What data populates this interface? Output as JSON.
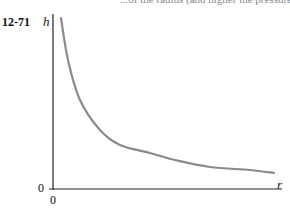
{
  "header": {
    "top_text": "...of the radius (and higher the pressure).",
    "problem_number": "12-71"
  },
  "chart_data": {
    "type": "line",
    "title": "",
    "xlabel": "r",
    "ylabel": "h",
    "x_tick_labels": [
      "0"
    ],
    "y_tick_labels": [
      "0"
    ],
    "grid": false,
    "legend": null,
    "series": [
      {
        "name": "h vs r (decaying curve)",
        "color": "#8a8a8a",
        "points_px": [
          [
            61,
            18
          ],
          [
            68,
            60
          ],
          [
            80,
            100
          ],
          [
            100,
            130
          ],
          [
            120,
            145
          ],
          [
            150,
            153
          ],
          [
            175,
            160
          ],
          [
            210,
            167
          ],
          [
            250,
            170
          ],
          [
            274,
            173
          ]
        ]
      }
    ]
  }
}
